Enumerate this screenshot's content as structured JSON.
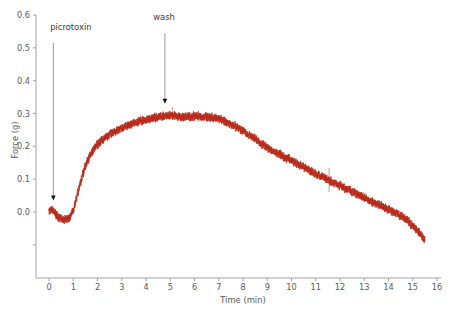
{
  "chart_data": {
    "type": "line",
    "title": "",
    "xlabel": "Time (min)",
    "ylabel": "Force (g)",
    "xlim": [
      -0.35,
      16.2
    ],
    "ylim": [
      -0.13,
      0.62
    ],
    "grid": false,
    "legend": "none",
    "trace_color": "#b8291a",
    "line_noise_amplitude": 0.009,
    "xticks": [
      0,
      1,
      2,
      3,
      4,
      5,
      6,
      7,
      8,
      9,
      10,
      11,
      12,
      13,
      14,
      15,
      16
    ],
    "xticklabels": [
      "0",
      "1",
      "2",
      "3",
      "4",
      "5",
      "6",
      "7",
      "8",
      "9",
      "10",
      "11",
      "12",
      "13",
      "14",
      "15",
      "16"
    ],
    "yticks": [
      -0.1,
      0.0,
      0.1,
      0.2,
      0.3,
      0.4,
      0.5,
      0.6
    ],
    "yticklabels": [
      "",
      "0.0",
      "0.1",
      "0.2",
      "0.3",
      "0.4",
      "0.5",
      "0.6"
    ],
    "series": [
      {
        "name": "force-trace",
        "color": "#b8291a",
        "x": [
          0.0,
          0.1,
          0.2,
          0.3,
          0.4,
          0.5,
          0.6,
          0.7,
          0.8,
          0.9,
          1.0,
          1.1,
          1.2,
          1.3,
          1.4,
          1.5,
          1.6,
          1.7,
          1.8,
          1.9,
          2.0,
          2.2,
          2.4,
          2.6,
          2.8,
          3.0,
          3.2,
          3.4,
          3.6,
          3.8,
          4.0,
          4.2,
          4.4,
          4.6,
          4.8,
          5.0,
          5.2,
          5.4,
          5.6,
          5.8,
          6.0,
          6.2,
          6.4,
          6.6,
          6.8,
          7.0,
          7.2,
          7.4,
          7.6,
          7.8,
          8.0,
          8.25,
          8.5,
          8.75,
          9.0,
          9.25,
          9.5,
          9.75,
          10.0,
          10.25,
          10.5,
          10.75,
          11.0,
          11.25,
          11.5,
          11.75,
          12.0,
          12.25,
          12.5,
          12.75,
          13.0,
          13.25,
          13.5,
          13.75,
          14.0,
          14.25,
          14.5,
          14.75,
          15.0,
          15.25,
          15.5
        ],
        "y": [
          0.005,
          0.008,
          0.004,
          -0.008,
          -0.018,
          -0.022,
          -0.024,
          -0.023,
          -0.021,
          -0.012,
          0.005,
          0.032,
          0.062,
          0.092,
          0.118,
          0.14,
          0.158,
          0.173,
          0.186,
          0.197,
          0.206,
          0.22,
          0.232,
          0.241,
          0.249,
          0.256,
          0.262,
          0.268,
          0.273,
          0.278,
          0.282,
          0.285,
          0.288,
          0.29,
          0.292,
          0.294,
          0.293,
          0.29,
          0.289,
          0.29,
          0.291,
          0.291,
          0.29,
          0.289,
          0.287,
          0.284,
          0.279,
          0.272,
          0.264,
          0.256,
          0.247,
          0.234,
          0.221,
          0.208,
          0.196,
          0.186,
          0.176,
          0.166,
          0.156,
          0.146,
          0.136,
          0.126,
          0.116,
          0.107,
          0.098,
          0.089,
          0.08,
          0.071,
          0.062,
          0.053,
          0.044,
          0.035,
          0.026,
          0.017,
          0.008,
          -0.001,
          -0.012,
          -0.025,
          -0.042,
          -0.062,
          -0.082
        ]
      }
    ],
    "annotations": [
      {
        "name": "picrotoxin",
        "label": "picrotoxin",
        "x": 0.18,
        "label_x": 0.05,
        "label_y": 0.555,
        "arrow_from_y": 0.515,
        "arrow_to_y": 0.035
      },
      {
        "name": "wash",
        "label": "wash",
        "x": 4.78,
        "label_x": 4.3,
        "label_y": 0.585,
        "arrow_from_y": 0.545,
        "arrow_to_y": 0.33
      }
    ],
    "artifacts": [
      {
        "name": "spike-artifact",
        "x": 11.55,
        "y_low": 0.06,
        "y_high": 0.135
      },
      {
        "name": "spike-artifact",
        "x": 5.1,
        "y_low": 0.292,
        "y_high": 0.32
      }
    ]
  }
}
